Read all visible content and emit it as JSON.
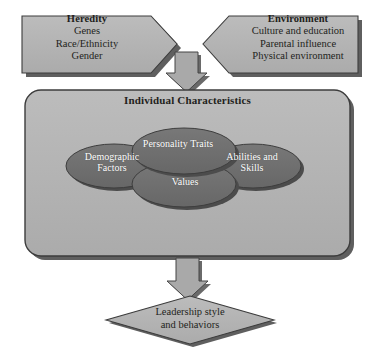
{
  "diagram": {
    "type": "flowchart",
    "colors": {
      "shape_fill": "#b3b3b3",
      "shape_stroke": "#3a3a3a",
      "shadow": "#5a5a5a",
      "ellipse_fill": "#6e6e6e",
      "ellipse_stroke": "#3d3d3d",
      "arrow_fill": "#a8a8a8",
      "text": "#231f20",
      "ellipse_text": "#ffffff",
      "background": "#ffffff"
    },
    "inputs": [
      {
        "id": "heredity",
        "shape": "pentagon-right",
        "heading": "Heredity",
        "lines": [
          "Genes",
          "Race/Ethnicity",
          "Gender"
        ]
      },
      {
        "id": "environment",
        "shape": "pentagon-left",
        "heading": "Environment",
        "lines": [
          "Culture and education",
          "Parental influence",
          "Physical environment"
        ]
      }
    ],
    "connectors": [
      {
        "id": "arrow-top",
        "shape": "down-arrow"
      },
      {
        "id": "arrow-bottom",
        "shape": "down-arrow"
      }
    ],
    "main_box": {
      "id": "individual-characteristics",
      "title": "Individual Characteristics",
      "shape": "rounded-rectangle",
      "ellipses": [
        {
          "id": "demographic",
          "lines": [
            "Demographic",
            "Factors"
          ]
        },
        {
          "id": "personality",
          "lines": [
            "Personality",
            "Traits"
          ]
        },
        {
          "id": "values",
          "lines": [
            "Values"
          ]
        },
        {
          "id": "abilities",
          "lines": [
            "Abilities and",
            "Skills"
          ]
        }
      ]
    },
    "outcome": {
      "id": "leadership-outcome",
      "shape": "diamond",
      "lines": [
        "Leadership style",
        "and behaviors"
      ]
    }
  }
}
